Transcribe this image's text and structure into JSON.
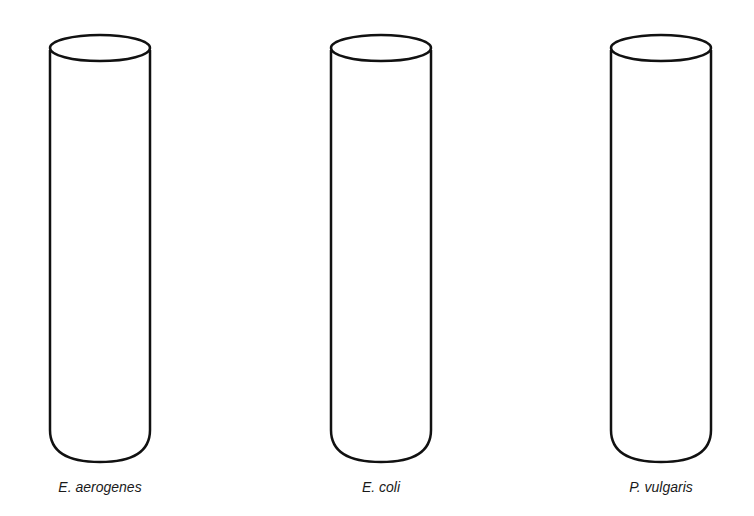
{
  "tubes": [
    {
      "label": "E. aerogenes",
      "cx": 100
    },
    {
      "label": "E. coli",
      "cx": 381
    },
    {
      "label": "P. vulgaris",
      "cx": 661
    }
  ],
  "stroke_color": "#111111"
}
